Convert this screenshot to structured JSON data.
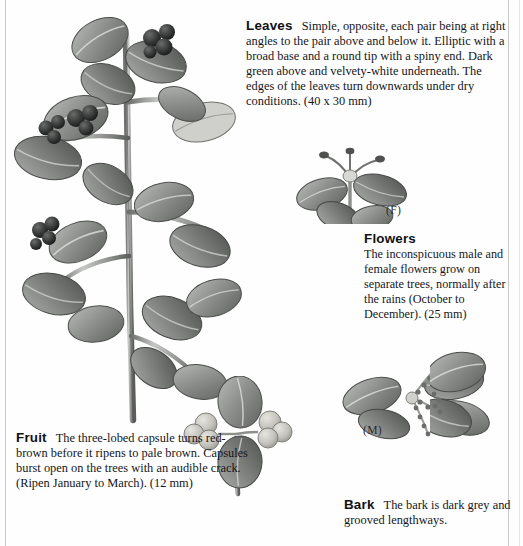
{
  "page": {
    "background_color": "#fefefe",
    "text_color": "#15161a",
    "rule_color": "#c9c9c9"
  },
  "sections": {
    "leaves": {
      "heading": "Leaves",
      "body": "Simple, opposite, each pair being at right angles to the pair above and below it. Elliptic with a broad base and a round tip with a spiny end. Dark green above and velvety-white underneath. The edges of the leaves turn downwards under dry conditions. (40 x 30 mm)"
    },
    "flowers": {
      "heading": "Flowers",
      "body": "The inconspicuous male and female flowers grow on separate trees, normally after the rains (October to December). (25 mm)"
    },
    "fruit": {
      "heading": "Fruit",
      "body": "The three-lobed capsule turns red-brown before it ripens to pale brown. Capsules burst open on the trees with an audible crack. (Ripen January to March). (12 mm)"
    },
    "bark": {
      "heading": "Bark",
      "body": "The bark is dark grey and grooved lengthways."
    }
  },
  "figure_labels": {
    "female": "(F)",
    "male": "(M)"
  },
  "illustrations": [
    {
      "name": "leafy-branch-with-fruit",
      "caption_ref": "leaves"
    },
    {
      "name": "female-flower-sprig",
      "caption_ref": "flowers"
    },
    {
      "name": "fruit-capsule-sprig",
      "caption_ref": "fruit"
    },
    {
      "name": "male-flower-sprig",
      "caption_ref": "bark"
    }
  ]
}
